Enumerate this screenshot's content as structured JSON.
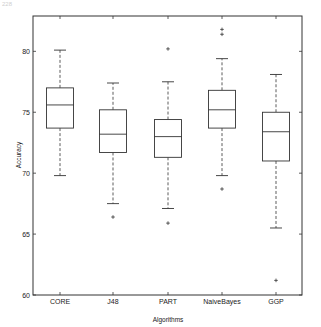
{
  "header": {
    "text": "228"
  },
  "chart_data": {
    "type": "box",
    "title": "",
    "xlabel": "Algorithms",
    "ylabel": "Accuracy",
    "ylim": [
      60,
      82.9
    ],
    "yticks": [
      60,
      65,
      70,
      75,
      80
    ],
    "grid": false,
    "categories": [
      "CORE",
      "J48",
      "PART",
      "NaiveBayes",
      "GGP"
    ],
    "boxes": [
      {
        "name": "CORE",
        "whisker_low": 69.8,
        "q1": 73.7,
        "median": 75.6,
        "q3": 77.0,
        "whisker_high": 80.1,
        "outliers": []
      },
      {
        "name": "J48",
        "whisker_low": 67.5,
        "q1": 71.7,
        "median": 73.2,
        "q3": 75.2,
        "whisker_high": 77.4,
        "outliers": [
          66.4
        ]
      },
      {
        "name": "PART",
        "whisker_low": 67.1,
        "q1": 71.3,
        "median": 73.0,
        "q3": 74.4,
        "whisker_high": 77.5,
        "outliers": [
          65.9,
          80.2
        ]
      },
      {
        "name": "NaiveBayes",
        "whisker_low": 69.8,
        "q1": 73.7,
        "median": 75.2,
        "q3": 76.8,
        "whisker_high": 79.4,
        "outliers": [
          68.7,
          81.4,
          81.8
        ]
      },
      {
        "name": "GGP",
        "whisker_low": 65.5,
        "q1": 71.0,
        "median": 73.4,
        "q3": 75.0,
        "whisker_high": 78.1,
        "outliers": [
          61.2
        ]
      }
    ]
  }
}
